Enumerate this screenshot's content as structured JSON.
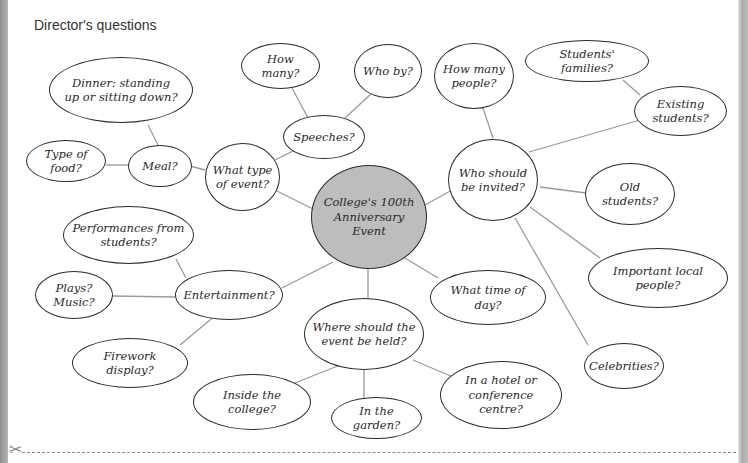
{
  "title": "Director's questions",
  "center": "College's 100th\nAnniversary Event",
  "nodes": {
    "what_type": "What type\nof event?",
    "meal": "Meal?",
    "type_of_food": "Type of food?",
    "dinner": "Dinner: standing\nup or sitting down?",
    "speeches": "Speeches?",
    "how_many": "How many?",
    "who_by": "Who by?",
    "who_invited": "Who should\nbe invited?",
    "how_many_people": "How many\npeople?",
    "students_families": "Students' families?",
    "existing_students": "Existing\nstudents?",
    "old_students": "Old students?",
    "important_local": "Important local people?",
    "celebrities": "Celebrities?",
    "what_time": "What time of day?",
    "where_held": "Where should the\nevent be held?",
    "inside_college": "Inside the college?",
    "in_garden": "In the garden?",
    "hotel": "In a hotel or\nconference centre?",
    "entertainment": "Entertainment?",
    "performances": "Performances from\nstudents?",
    "plays_music": "Plays?\nMusic?",
    "firework": "Firework display?"
  },
  "icons": {
    "scissors": "✂"
  },
  "colors": {
    "center_fill": "#bdbdbd",
    "stroke": "#2b2b2b",
    "line": "#9a9a9a"
  }
}
